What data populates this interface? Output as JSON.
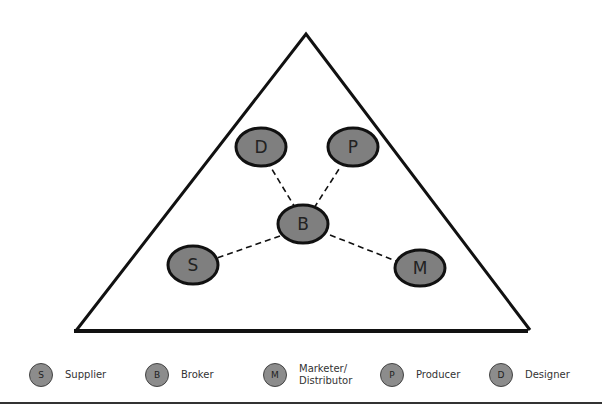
{
  "diagram": {
    "type": "network-triangle",
    "colors": {
      "node_fill": "#7f7f7f",
      "node_stroke": "#111111",
      "line": "#111111",
      "legend_fill": "#8c8c8c"
    },
    "nodes": [
      {
        "id": "D",
        "label": "D",
        "name": "Designer"
      },
      {
        "id": "P",
        "label": "P",
        "name": "Producer"
      },
      {
        "id": "B",
        "label": "B",
        "name": "Broker"
      },
      {
        "id": "S",
        "label": "S",
        "name": "Supplier"
      },
      {
        "id": "M",
        "label": "M",
        "name": "Marketer/Distributor"
      }
    ],
    "edges": [
      {
        "from": "B",
        "to": "D",
        "style": "dashed"
      },
      {
        "from": "B",
        "to": "P",
        "style": "dashed"
      },
      {
        "from": "B",
        "to": "S",
        "style": "dashed"
      },
      {
        "from": "B",
        "to": "M",
        "style": "dashed"
      }
    ]
  },
  "legend": [
    {
      "symbol": "S",
      "label": "Supplier"
    },
    {
      "symbol": "B",
      "label": "Broker"
    },
    {
      "symbol": "M",
      "label_line1": "Marketer/",
      "label_line2": "Distributor"
    },
    {
      "symbol": "P",
      "label": "Producer"
    },
    {
      "symbol": "D",
      "label": "Designer"
    }
  ]
}
